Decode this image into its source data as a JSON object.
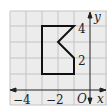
{
  "diagram": {
    "type": "coordinate-grid",
    "colors": {
      "background": "#ffffff",
      "grid_fill": "#ececec",
      "grid_line": "#c4c4c4",
      "axis": "#222222",
      "shape": "#111111"
    },
    "axes": {
      "x_label": "x",
      "y_label": "y",
      "origin_label": "O",
      "x_ticks": [
        {
          "value": -4,
          "label": "−4"
        },
        {
          "value": -2,
          "label": "−2"
        }
      ],
      "y_ticks": [
        {
          "value": 4,
          "label": "4"
        },
        {
          "value": 2,
          "label": "2"
        }
      ],
      "x_range": [
        -5,
        1
      ],
      "y_range": [
        -1,
        5
      ]
    },
    "shape": {
      "name": "polygon",
      "vertices": [
        [
          -3,
          4
        ],
        [
          -1,
          4
        ],
        [
          -2,
          3
        ],
        [
          -1,
          2
        ],
        [
          -1,
          1
        ],
        [
          -3,
          1
        ]
      ]
    }
  }
}
